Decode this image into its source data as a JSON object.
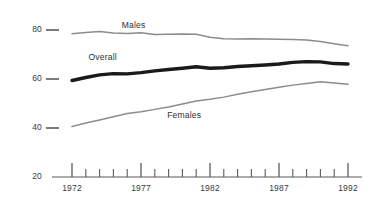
{
  "chart_data": {
    "type": "line",
    "title": "",
    "subtitle": "",
    "xlabel": "",
    "ylabel": "",
    "xlim": [
      1972,
      1992
    ],
    "ylim": [
      20,
      80
    ],
    "grid": false,
    "legend_position": "inline-labels",
    "y_ticks": [
      80,
      60,
      40,
      20
    ],
    "x_ticks": [
      1972,
      1977,
      1982,
      1987,
      1992
    ],
    "x_minor_ticks": [
      1973,
      1974,
      1975,
      1976,
      1978,
      1979,
      1980,
      1981,
      1983,
      1984,
      1985,
      1986,
      1988,
      1989,
      1990,
      1991
    ],
    "x": [
      1972,
      1973,
      1974,
      1975,
      1976,
      1977,
      1978,
      1979,
      1980,
      1981,
      1982,
      1983,
      1984,
      1985,
      1986,
      1987,
      1988,
      1989,
      1990,
      1991,
      1992
    ],
    "series": [
      {
        "name": "Males",
        "color": "#8c8c8c",
        "width": 1.5,
        "values": [
          78.5,
          79.0,
          79.4,
          78.8,
          78.6,
          78.9,
          78.2,
          78.3,
          78.4,
          78.3,
          77.0,
          76.4,
          76.3,
          76.4,
          76.3,
          76.2,
          76.1,
          75.9,
          75.3,
          74.4,
          73.6
        ]
      },
      {
        "name": "Overall",
        "color": "#1a1a1a",
        "width": 3.4,
        "values": [
          59.4,
          60.6,
          61.7,
          62.2,
          62.1,
          62.6,
          63.3,
          63.9,
          64.4,
          65.0,
          64.4,
          64.6,
          65.1,
          65.4,
          65.7,
          66.1,
          66.8,
          67.1,
          67.0,
          66.3,
          66.1
        ]
      },
      {
        "name": "Females",
        "color": "#8c8c8c",
        "width": 1.5,
        "values": [
          40.6,
          42.0,
          43.3,
          44.6,
          45.9,
          46.6,
          47.6,
          48.6,
          49.8,
          51.0,
          51.7,
          52.6,
          53.8,
          54.8,
          55.7,
          56.6,
          57.5,
          58.2,
          58.9,
          58.4,
          57.9
        ]
      }
    ],
    "annotations": [
      {
        "text": "Males",
        "x": 1975.6,
        "y": 82.0
      },
      {
        "text": "Overall",
        "x": 1973.2,
        "y": 69.0
      },
      {
        "text": "Females",
        "x": 1978.9,
        "y": 45.3
      }
    ]
  },
  "axis": {
    "y_labels": [
      "80",
      "60",
      "40",
      "20"
    ],
    "x_labels": [
      "1972",
      "1977",
      "1982",
      "1987",
      "1992"
    ]
  },
  "style": {
    "line_gray": "#8c8c8c",
    "line_black": "#1a1a1a",
    "axis_color": "#5a5a5a",
    "text_color": "#3a3a3a",
    "background": "#ffffff"
  }
}
